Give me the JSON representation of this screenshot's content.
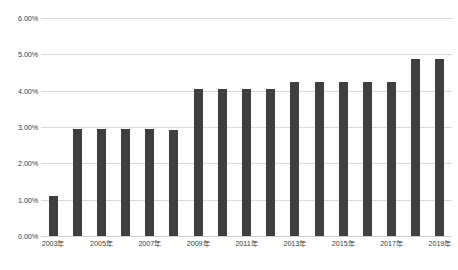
{
  "chart_data": {
    "type": "bar",
    "title": "",
    "subtitle": "",
    "xlabel": "",
    "ylabel": "",
    "categories": [
      "2003年",
      "2004年",
      "2005年",
      "2006年",
      "2007年",
      "2008年",
      "2009年",
      "2010年",
      "2011年",
      "2012年",
      "2013年",
      "2014年",
      "2015年",
      "2016年",
      "2017年",
      "2018年",
      "2019年"
    ],
    "visible_tick_labels": [
      "2003年",
      "2005年",
      "2007年",
      "2009年",
      "2011年",
      "2013年",
      "2015年",
      "2017年",
      "2019年"
    ],
    "values": [
      1.1,
      2.95,
      2.95,
      2.95,
      2.95,
      2.93,
      4.05,
      4.05,
      4.05,
      4.05,
      4.25,
      4.25,
      4.25,
      4.25,
      4.25,
      4.87,
      4.87
    ],
    "ylim": [
      0,
      6
    ],
    "ytick_values": [
      0,
      1,
      2,
      3,
      4,
      5,
      6
    ],
    "ytick_labels": [
      "0.00%",
      "1.00%",
      "2.00%",
      "3.00%",
      "4.00%",
      "5.00%",
      "6.00%"
    ],
    "grid": true,
    "legend": false,
    "bar_color": "#3f3f3f",
    "gridline_color": "#d9d9d9",
    "background_color": "#ffffff",
    "text_color": "#3a3a3a"
  }
}
